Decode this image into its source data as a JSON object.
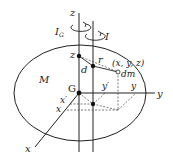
{
  "diagram": {
    "labels": {
      "z_axis": "z",
      "I_G": "I",
      "I_G_sub": "G",
      "I": "I",
      "z_point": "z",
      "r": "r",
      "coords": "(x, y, z)",
      "d": "d",
      "dm": "dm",
      "M": "M",
      "G": "G",
      "y_prime": "y′",
      "y_inner": "y",
      "y_axis": "y",
      "x_prime": "x′",
      "x_inner": "x",
      "x_axis": "x"
    },
    "colors": {
      "line": "#222222",
      "background": "#ffffff"
    }
  }
}
